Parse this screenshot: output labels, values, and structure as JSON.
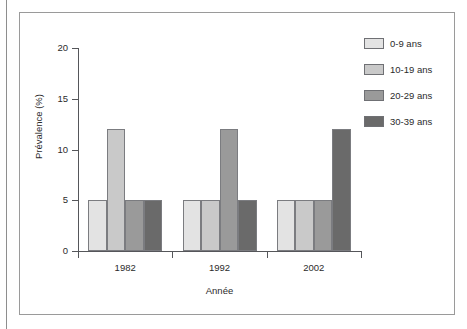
{
  "figure": {
    "frame_border_color": "#9a9a9a",
    "background": "#ffffff"
  },
  "chart_data": {
    "type": "bar",
    "title": "",
    "subtitle": "",
    "xlabel": "Année",
    "ylabel": "Prévalence (%)",
    "categories": [
      "1982",
      "1992",
      "2002"
    ],
    "ylim": [
      0,
      20
    ],
    "yticks": [
      0,
      5,
      10,
      15,
      20
    ],
    "ytick_labels": [
      "0",
      "5",
      "10",
      "15",
      "20"
    ],
    "grid": false,
    "legend_position": "right",
    "grouped": true,
    "series": [
      {
        "name": "0-9 ans",
        "color": "#e3e3e3",
        "values": [
          5,
          5,
          5
        ]
      },
      {
        "name": "10-19 ans",
        "color": "#c9c9c9",
        "values": [
          12,
          5,
          5
        ]
      },
      {
        "name": "20-29 ans",
        "color": "#9a9a9a",
        "values": [
          5,
          12,
          5
        ]
      },
      {
        "name": "30-39 ans",
        "color": "#6a6a6a",
        "values": [
          5,
          5,
          12
        ]
      }
    ]
  }
}
